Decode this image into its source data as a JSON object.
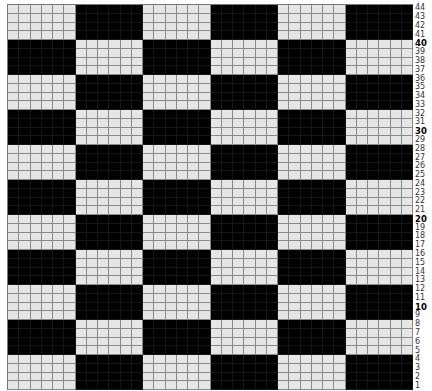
{
  "chart": {
    "title": "",
    "rows": 44,
    "columns": 36,
    "block_width": 6,
    "block_height": 4,
    "colors": {
      "light": "#e6e6e6",
      "dark": "#000000",
      "gridline": "#8a8a8a"
    },
    "pattern": "checkerboard",
    "top_left_block": "light",
    "row_labels": [
      "44",
      "43",
      "42",
      "41",
      "40",
      "39",
      "38",
      "37",
      "36",
      "35",
      "34",
      "33",
      "32",
      "31",
      "30",
      "29",
      "28",
      "27",
      "26",
      "25",
      "24",
      "23",
      "22",
      "21",
      "20",
      "19",
      "18",
      "17",
      "16",
      "15",
      "14",
      "13",
      "12",
      "11",
      "10",
      "9",
      "8",
      "7",
      "6",
      "5",
      "4",
      "3",
      "2",
      "1"
    ],
    "bold_labels": [
      "40",
      "30",
      "20",
      "10"
    ]
  }
}
